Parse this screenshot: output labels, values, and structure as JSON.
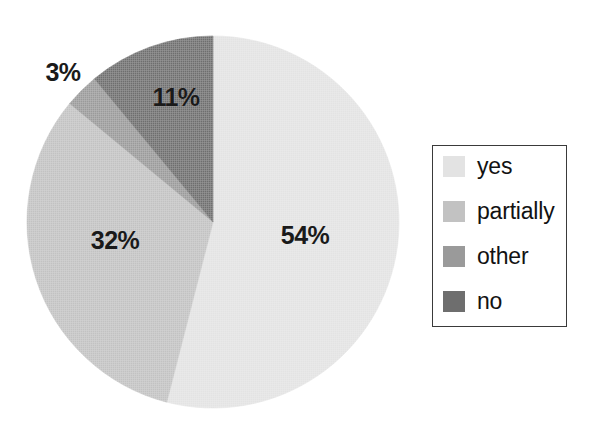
{
  "chart_data": {
    "type": "pie",
    "title": "",
    "categories": [
      "yes",
      "partially",
      "other",
      "no"
    ],
    "values": [
      54,
      32,
      3,
      11
    ],
    "value_labels": [
      "54%",
      "32%",
      "3%",
      "11%"
    ],
    "units": "percent",
    "legend_position": "right",
    "grid": false,
    "start_angle_deg": 0,
    "direction": "clockwise",
    "colors": [
      "#e3e3e3",
      "#c2c2c2",
      "#9a9a9a",
      "#6e6e6e"
    ]
  },
  "legend": {
    "items": [
      {
        "label": "yes",
        "color": "#e3e3e3"
      },
      {
        "label": "partially",
        "color": "#c2c2c2"
      },
      {
        "label": "other",
        "color": "#9a9a9a"
      },
      {
        "label": "no",
        "color": "#6e6e6e"
      }
    ],
    "border_color": "#3a3a3a"
  },
  "pie": {
    "center_x": 213,
    "center_y": 222,
    "radius": 186,
    "slices": [
      {
        "name": "yes",
        "percent_label": "54%",
        "value": 54,
        "color": "#e3e3e3"
      },
      {
        "name": "partially",
        "percent_label": "32%",
        "value": 32,
        "color": "#c2c2c2"
      },
      {
        "name": "other",
        "percent_label": "3%",
        "value": 3,
        "color": "#9a9a9a"
      },
      {
        "name": "no",
        "percent_label": "11%",
        "value": 11,
        "color": "#6e6e6e"
      }
    ]
  }
}
